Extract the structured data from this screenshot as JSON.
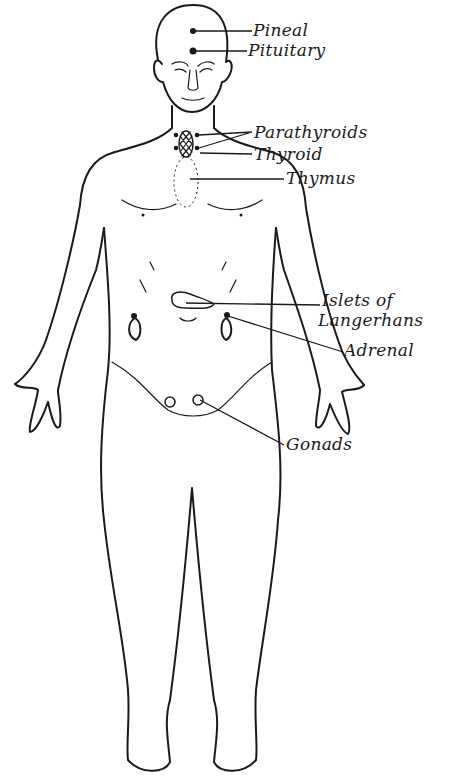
{
  "figure": {
    "labels": [
      {
        "id": "pineal",
        "text": "Pineal",
        "x": 253,
        "y": 20,
        "target": [
          193,
          31
        ]
      },
      {
        "id": "pituitary",
        "text": "Pituitary",
        "x": 248,
        "y": 41,
        "target": [
          193,
          51
        ]
      },
      {
        "id": "parathyroids",
        "text": "Parathyroids",
        "x": 254,
        "y": 124,
        "target": [
          199,
          135
        ]
      },
      {
        "id": "thyroid",
        "text": "Thyroid",
        "x": 254,
        "y": 146,
        "target": [
          200,
          153
        ]
      },
      {
        "id": "thymus",
        "text": "Thymus",
        "x": 286,
        "y": 170,
        "target": [
          188,
          179
        ]
      },
      {
        "id": "islets",
        "text": "Islets of",
        "text2": "Langerhans",
        "x": 322,
        "y": 292,
        "target": [
          185,
          303
        ]
      },
      {
        "id": "adrenal",
        "text": "Adrenal",
        "x": 344,
        "y": 342,
        "target": [
          226,
          313
        ]
      },
      {
        "id": "gonads",
        "text": "Gonads",
        "x": 286,
        "y": 436,
        "target": [
          200,
          400
        ]
      }
    ],
    "colors": {
      "ink": "#1a1a1a",
      "background": "#ffffff"
    }
  }
}
